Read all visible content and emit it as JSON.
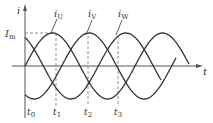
{
  "diagram": {
    "axes": {
      "y_label": "i",
      "x_label": "t",
      "amplitude_label_main": "I",
      "amplitude_label_sub": "m"
    },
    "curves": [
      {
        "name": "U",
        "label_main": "i",
        "label_sub": "U",
        "phase_deg": 0
      },
      {
        "name": "V",
        "label_main": "i",
        "label_sub": "V",
        "phase_deg": -120
      },
      {
        "name": "W",
        "label_main": "i",
        "label_sub": "W",
        "phase_deg": 120
      }
    ],
    "time_marks": [
      {
        "main": "t",
        "sub": "0"
      },
      {
        "main": "t",
        "sub": "1"
      },
      {
        "main": "t",
        "sub": "2"
      },
      {
        "main": "t",
        "sub": "3"
      }
    ],
    "colors": {
      "curve": "#333333",
      "axis": "#555555",
      "dash": "#777777"
    }
  }
}
